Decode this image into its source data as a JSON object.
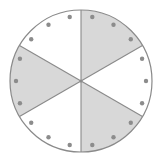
{
  "diagram": {
    "type": "fraction-circle",
    "center": [
      81,
      81
    ],
    "radius": 71,
    "sectors": 6,
    "shaded_sectors": [
      {
        "start_deg": 30,
        "end_deg": 90
      },
      {
        "start_deg": 150,
        "end_deg": 210
      },
      {
        "start_deg": 270,
        "end_deg": 330
      }
    ],
    "dots": {
      "count": 18,
      "radius": 65,
      "step_deg": 20,
      "start_deg": 0,
      "size": 2.2
    },
    "colors": {
      "shade": "#d8d8d8",
      "background": "#ffffff",
      "line": "#8a8a8a",
      "dot": "#8c8c8c"
    }
  }
}
